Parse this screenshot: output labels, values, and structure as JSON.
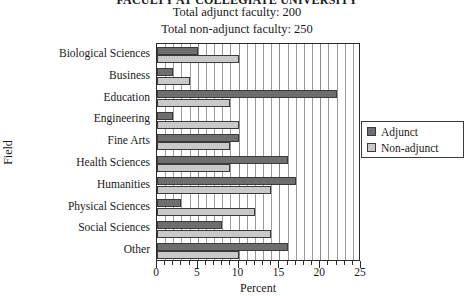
{
  "titles": {
    "main": "FACULTY AT COLLEGIATE UNIVERSITY",
    "line1": "Total adjunct faculty:  200",
    "line2": "Total non-adjunct faculty:  250"
  },
  "axes": {
    "x_title": "Percent",
    "y_title": "Field",
    "x_min": 0,
    "x_max": 25,
    "x_major_step": 5,
    "x_minor_step": 1,
    "x_tick_labels": [
      "0",
      "5",
      "10",
      "15",
      "20",
      "25"
    ]
  },
  "legend": {
    "position": "right",
    "items": [
      {
        "label": "Adjunct",
        "color": "#6e6e6e"
      },
      {
        "label": "Non-adjunct",
        "color": "#c9c9c9"
      }
    ]
  },
  "chart_data": {
    "type": "bar",
    "orientation": "horizontal",
    "title": "FACULTY AT COLLEGIATE UNIVERSITY",
    "subtitle": "Total adjunct faculty: 200 / Total non-adjunct faculty: 250",
    "xlabel": "Percent",
    "ylabel": "Field",
    "xlim": [
      0,
      25
    ],
    "grid": true,
    "legend_position": "right",
    "categories": [
      "Biological Sciences",
      "Business",
      "Education",
      "Engineering",
      "Fine Arts",
      "Health Sciences",
      "Humanities",
      "Physical Sciences",
      "Social Sciences",
      "Other"
    ],
    "series": [
      {
        "name": "Adjunct",
        "color": "#6e6e6e",
        "values": [
          5,
          2,
          22,
          2,
          10,
          16,
          17,
          3,
          8,
          16
        ]
      },
      {
        "name": "Non-adjunct",
        "color": "#c9c9c9",
        "values": [
          10,
          4,
          9,
          10,
          9,
          9,
          14,
          12,
          14,
          10
        ]
      }
    ]
  }
}
